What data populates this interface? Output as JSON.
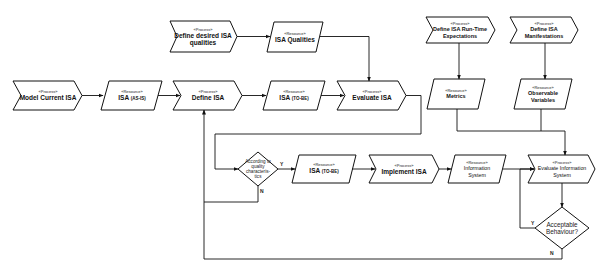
{
  "diagram": {
    "type": "process-flow",
    "stereotypes": {
      "process": "«Process»",
      "resource": "«Resource»"
    },
    "nodes": [
      {
        "id": "model-current-isa",
        "kind": "process",
        "label": "Model Current ISA"
      },
      {
        "id": "isa-as-is",
        "kind": "resource",
        "label": "ISA",
        "sub": "(AS-IS)"
      },
      {
        "id": "define-isa",
        "kind": "process",
        "label": "Define ISA"
      },
      {
        "id": "isa-to-be-1",
        "kind": "resource",
        "label": "ISA",
        "sub": "(TO-BE)"
      },
      {
        "id": "evaluate-isa",
        "kind": "process",
        "label": "Evaluate ISA"
      },
      {
        "id": "define-desired-qualities",
        "kind": "process",
        "label": "Define desired ISA qualities"
      },
      {
        "id": "isa-qualities",
        "kind": "resource",
        "label": "ISA Qualities"
      },
      {
        "id": "define-runtime-expectations",
        "kind": "process",
        "label": "Define ISA Run-Time Expectations"
      },
      {
        "id": "define-manifestations",
        "kind": "process",
        "label": "Define ISA Manifestations"
      },
      {
        "id": "metrics",
        "kind": "resource",
        "label": "Metrics"
      },
      {
        "id": "observable-variables",
        "kind": "resource",
        "label": "Observable Variables"
      },
      {
        "id": "quality-decision",
        "kind": "decision",
        "label": "According to quality characteris-tics"
      },
      {
        "id": "isa-to-be-2",
        "kind": "resource",
        "label": "ISA",
        "sub": "(TO-BE)"
      },
      {
        "id": "implement-isa",
        "kind": "process",
        "label": "Implement ISA"
      },
      {
        "id": "information-system",
        "kind": "resource",
        "label": "Information System"
      },
      {
        "id": "evaluate-information-system",
        "kind": "process",
        "label": "Evaluate Information System"
      },
      {
        "id": "acceptable-decision",
        "kind": "decision",
        "label": "Acceptable Behaviour?"
      }
    ],
    "edge_labels": {
      "yes": "Y",
      "no": "N"
    },
    "edges": [
      [
        "model-current-isa",
        "isa-as-is"
      ],
      [
        "isa-as-is",
        "define-isa"
      ],
      [
        "define-isa",
        "isa-to-be-1"
      ],
      [
        "isa-to-be-1",
        "evaluate-isa"
      ],
      [
        "define-desired-qualities",
        "isa-qualities"
      ],
      [
        "isa-qualities",
        "evaluate-isa"
      ],
      [
        "evaluate-isa",
        "quality-decision"
      ],
      [
        "quality-decision",
        "isa-to-be-2",
        "Y"
      ],
      [
        "quality-decision",
        "define-isa",
        "N"
      ],
      [
        "isa-to-be-2",
        "implement-isa"
      ],
      [
        "implement-isa",
        "information-system"
      ],
      [
        "information-system",
        "evaluate-information-system"
      ],
      [
        "define-runtime-expectations",
        "metrics"
      ],
      [
        "define-manifestations",
        "observable-variables"
      ],
      [
        "metrics",
        "evaluate-information-system"
      ],
      [
        "observable-variables",
        "evaluate-information-system"
      ],
      [
        "evaluate-information-system",
        "acceptable-decision"
      ],
      [
        "acceptable-decision",
        "evaluate-information-system",
        "Y"
      ],
      [
        "acceptable-decision",
        "define-isa",
        "N"
      ]
    ]
  }
}
